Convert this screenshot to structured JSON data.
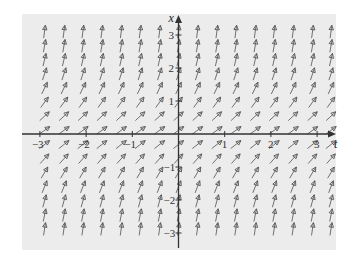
{
  "chart_data": {
    "type": "direction_field",
    "title": "",
    "equation_inferred": "dx/dt = 1 + x^2",
    "xlabel": "t",
    "ylabel": "x",
    "xlim": [
      -3.4,
      3.4
    ],
    "ylim": [
      -3.4,
      3.4
    ],
    "x_ticks": [
      -3,
      -2,
      -1,
      1,
      2,
      3
    ],
    "y_ticks": [
      -3,
      -2,
      -1,
      1,
      2,
      3
    ],
    "x_tick_labels": [
      "−3",
      "−2",
      "−1",
      "1",
      "2",
      "3"
    ],
    "y_tick_labels": [
      "−3",
      "−2",
      "−1",
      "1",
      "2",
      "3"
    ],
    "grid": false,
    "legend": null,
    "field_grid": {
      "t_values": [
        -2.9,
        -2.48,
        -2.07,
        -1.66,
        -1.24,
        -0.83,
        -0.41,
        0.0,
        0.41,
        0.83,
        1.24,
        1.66,
        2.07,
        2.48,
        2.9,
        3.3
      ],
      "x_values": [
        3.1,
        2.67,
        2.25,
        1.82,
        1.39,
        0.96,
        0.54,
        0.11,
        -0.32,
        -0.75,
        -1.17,
        -1.6,
        -2.03,
        -2.46,
        -2.88
      ],
      "slopes_by_row": [
        10.61,
        8.13,
        6.06,
        4.31,
        2.93,
        1.92,
        1.29,
        1.01,
        1.1,
        1.56,
        2.37,
        3.56,
        5.12,
        7.05,
        9.29
      ]
    }
  },
  "figure": {
    "background_color": "#ececec",
    "axis_color": "#333333",
    "arrow_color": "#707070",
    "arrow_head_color": "#555555"
  }
}
